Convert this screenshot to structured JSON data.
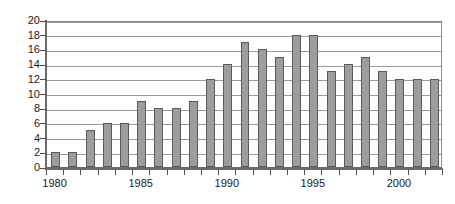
{
  "chart": {
    "title": "",
    "y_axis": {
      "labels": [
        "0",
        "2",
        "4",
        "6",
        "8",
        "10",
        "12",
        "14",
        "16",
        "18",
        "20"
      ],
      "min": 0,
      "max": 20,
      "step": 2
    },
    "x_axis": {
      "visible_labels": [
        "1980",
        "1985",
        "1990",
        "1995",
        "2000"
      ]
    },
    "colors": {
      "bar_fill": "#9d9d9d",
      "bar_stroke": "#5a5a5a",
      "gridline": "#9a9a9a",
      "axis": "#6b6b6b",
      "text": "#1a1a1a",
      "background": "#ffffff"
    }
  },
  "chart_data": {
    "type": "bar",
    "title": "",
    "xlabel": "",
    "ylabel": "",
    "ylim": [
      0,
      20
    ],
    "ytick_step": 2,
    "grid": true,
    "legend": "none",
    "categories": [
      "1980",
      "1981",
      "1982",
      "1983",
      "1984",
      "1985",
      "1986",
      "1987",
      "1988",
      "1989",
      "1990",
      "1991",
      "1992",
      "1993",
      "1994",
      "1995",
      "1996",
      "1997",
      "1998",
      "1999",
      "2000",
      "2001",
      "2002"
    ],
    "values": [
      2,
      2,
      5,
      6,
      6,
      9,
      8,
      8,
      9,
      12,
      14,
      17,
      16,
      15,
      18,
      18,
      13,
      14,
      15,
      13,
      12,
      12,
      12
    ],
    "labeled_ticks": [
      "1980",
      "1985",
      "1990",
      "1995",
      "2000"
    ]
  }
}
